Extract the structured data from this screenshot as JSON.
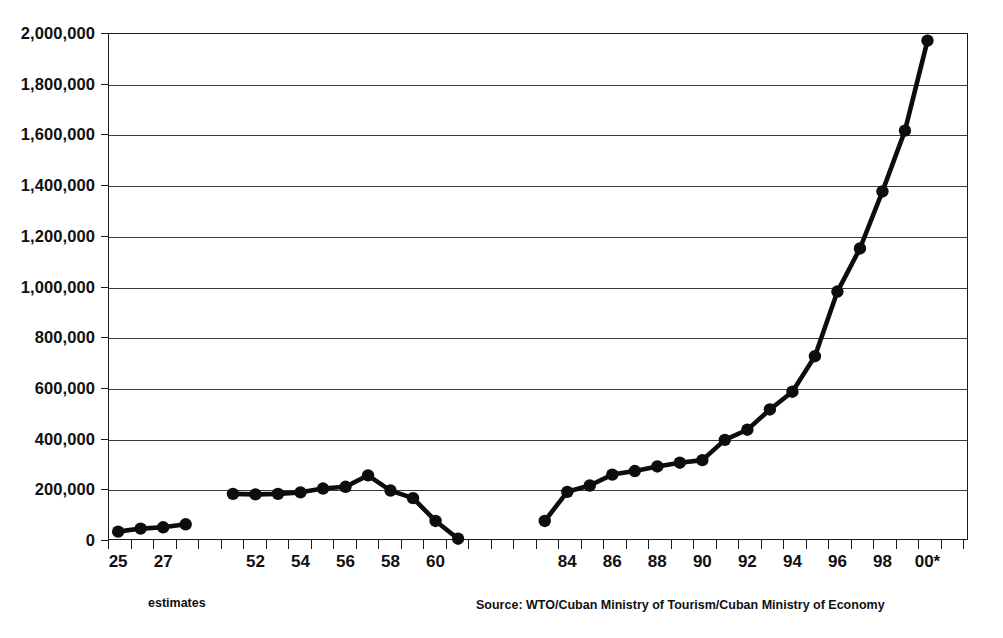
{
  "chart_data": {
    "type": "line",
    "title": "",
    "subtitle": "",
    "xlabel": "",
    "ylabel": "",
    "ylim": [
      0,
      2000000
    ],
    "y_ticks": [
      0,
      200000,
      400000,
      600000,
      800000,
      1000000,
      1200000,
      1400000,
      1600000,
      1800000,
      2000000
    ],
    "y_tick_labels": [
      "0",
      "200,000",
      "400,000",
      "600,000",
      "800,000",
      "1,000,000",
      "1,200,000",
      "1,400,000",
      "1,600,000",
      "1,800,000",
      "2,000,000"
    ],
    "grid": "horizontal",
    "legend": "none",
    "x_axis_note": "Two-digit years; ticks every year, labels every two years. Axis spans 1925-1928, 1951-1961, 1983-2000 with visual gaps between eras.",
    "x_tick_labels": [
      "25",
      "27",
      "52",
      "54",
      "56",
      "58",
      "60",
      "84",
      "86",
      "88",
      "90",
      "92",
      "94",
      "96",
      "98",
      "00*"
    ],
    "x_tick_label_years": [
      1925,
      1927,
      1952,
      1954,
      1956,
      1958,
      1960,
      1984,
      1986,
      1988,
      1990,
      1992,
      1994,
      1996,
      1998,
      2000
    ],
    "x_domain_years": [
      1924,
      1962
    ],
    "x_tick_years_all": [
      1925,
      1926,
      1927,
      1928,
      1929,
      1930,
      1931,
      1932,
      1933,
      1934,
      1935,
      1936,
      1937,
      1938,
      1939,
      1940,
      1941,
      1942,
      1943,
      1944,
      1945,
      1946,
      1947,
      1948,
      1949,
      1950,
      1951,
      1952,
      1953,
      1954,
      1955,
      1956,
      1957,
      1958,
      1959,
      1960,
      1961,
      1962,
      1963,
      1964,
      1965,
      1966,
      1967
    ],
    "series": [
      {
        "name": "estimates-1920s",
        "x": [
          1925,
          1926,
          1927,
          1928
        ],
        "values": [
          33000,
          45000,
          50000,
          62000
        ]
      },
      {
        "name": "1950s",
        "x": [
          1951,
          1952,
          1953,
          1954,
          1955,
          1956,
          1957,
          1958,
          1959,
          1960,
          1961
        ],
        "values": [
          182000,
          180000,
          182000,
          188000,
          203000,
          210000,
          255000,
          195000,
          165000,
          75000,
          5000
        ]
      },
      {
        "name": "modern",
        "x": [
          1983,
          1984,
          1985,
          1986,
          1987,
          1988,
          1989,
          1990,
          1991,
          1992,
          1993,
          1994,
          1995,
          1996,
          1997,
          1998,
          1999,
          2000
        ],
        "values": [
          75000,
          190000,
          215000,
          258000,
          272000,
          290000,
          305000,
          315000,
          395000,
          435000,
          515000,
          585000,
          725000,
          980000,
          1150000,
          1375000,
          1615000,
          1970000
        ]
      }
    ],
    "annotations": [
      {
        "id": "estimates",
        "text": "estimates"
      },
      {
        "id": "source",
        "text": "Source: WTO/Cuban Ministry of Tourism/Cuban Ministry of Economy"
      }
    ],
    "colors": {
      "line": "#0d0d0d",
      "marker": "#0d0d0d",
      "grid": "#3a3a3a",
      "axis": "#1a1a1a",
      "background": "#ffffff"
    }
  }
}
